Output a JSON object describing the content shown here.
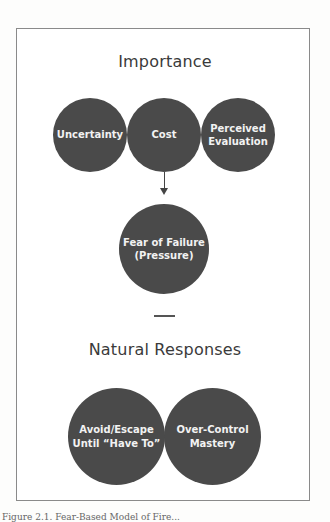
{
  "diagram": {
    "top_heading": "Importance",
    "factors": [
      {
        "label": "Uncertainty"
      },
      {
        "label": "Cost"
      },
      {
        "label": "Perceived\nEvaluation"
      }
    ],
    "arrow": "down-arrow",
    "outcome": {
      "label": "Fear of Failure\n(Pressure)"
    },
    "bottom_heading": "Natural Responses",
    "responses": [
      {
        "label": "Avoid/Escape\nUntil “Have To”"
      },
      {
        "label": "Over-Control\nMastery"
      }
    ],
    "colors": {
      "circle_fill": "#4a4a4a",
      "circle_text": "#f2f2f2",
      "heading_text": "#3a3a3a",
      "frame_border": "#8a8a8a"
    }
  },
  "caption": "Figure 2.1. Fear-Based Model of Fire..."
}
